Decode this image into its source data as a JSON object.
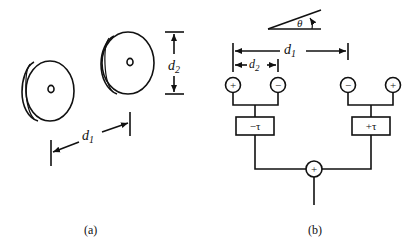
{
  "panel_a": {
    "caption": "(a)",
    "dimension_spacing": {
      "symbol": "d",
      "subscript": "1"
    },
    "dimension_diameter": {
      "symbol": "d",
      "subscript": "2"
    },
    "discs": [
      {
        "name": "left-disc"
      },
      {
        "name": "right-disc"
      }
    ]
  },
  "panel_b": {
    "caption": "(b)",
    "angle_label": "θ",
    "dimension_spacing": {
      "symbol": "d",
      "subscript": "1"
    },
    "dimension_diameter": {
      "symbol": "d",
      "subscript": "2"
    },
    "left_pair": {
      "polarities": [
        "+",
        "−"
      ],
      "delay_label": "−τ"
    },
    "right_pair": {
      "polarities": [
        "−",
        "+"
      ],
      "delay_label": "+τ"
    },
    "summer_label": "+"
  },
  "colors": {
    "ink": "#111111",
    "background": "#ffffff"
  }
}
